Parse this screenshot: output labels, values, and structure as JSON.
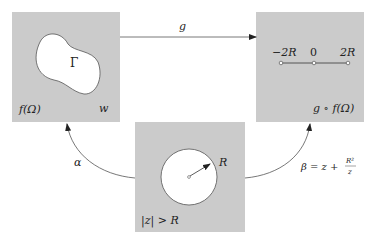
{
  "colors": {
    "panel": "#cbcbcb",
    "region": "#ffffff",
    "stroke": "#555555",
    "text": "#222222"
  },
  "panels": {
    "left": {
      "region_label": "Γ",
      "domain_label": "f(Ω)",
      "variable_label": "w"
    },
    "right": {
      "tick_labels": [
        "−2R",
        "0",
        "2R"
      ],
      "domain_label": "g ∘ f(Ω)"
    },
    "bottom": {
      "radius_label": "R",
      "domain_label": "|z| > R"
    }
  },
  "arrows": {
    "g": {
      "label": "g",
      "from": "left",
      "to": "right"
    },
    "alpha": {
      "label": "α",
      "from": "bottom",
      "to": "left"
    },
    "beta": {
      "label_prefix": "β = z + ",
      "frac_num": "R²",
      "frac_den": "z",
      "from": "bottom",
      "to": "right"
    }
  }
}
